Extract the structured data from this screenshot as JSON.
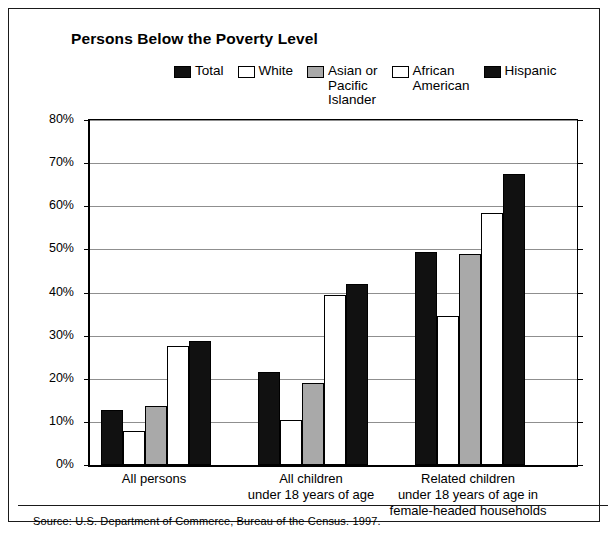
{
  "chart_data": {
    "type": "bar",
    "title": "Persons Below the Poverty Level",
    "xlabel": "",
    "ylabel": "",
    "ylim": [
      0,
      80
    ],
    "ytick_labels": [
      "0%",
      "10%",
      "20%",
      "30%",
      "40%",
      "50%",
      "60%",
      "70%",
      "80%"
    ],
    "ytick_values": [
      0,
      10,
      20,
      30,
      40,
      50,
      60,
      70,
      80
    ],
    "grid": true,
    "legend_position": "top",
    "categories": [
      "All persons",
      "All children\nunder 18 years of age",
      "Related children\nunder 18 years of age in\nfemale-headed households"
    ],
    "series": [
      {
        "name": "Total",
        "values": [
          12.7,
          21.5,
          49.5
        ],
        "fill": "#111111",
        "stroke": "#000000"
      },
      {
        "name": "White",
        "values": [
          8.0,
          10.5,
          34.5
        ],
        "fill": "#ffffff",
        "stroke": "#000000"
      },
      {
        "name": "Asian or\nPacific\nIslander",
        "values": [
          13.7,
          19.0,
          49.0
        ],
        "fill": "#a9a9a9",
        "stroke": "#000000"
      },
      {
        "name": "African\nAmerican",
        "values": [
          27.5,
          39.5,
          58.5
        ],
        "fill": "#ffffff",
        "stroke": "#000000"
      },
      {
        "name": "Hispanic",
        "values": [
          28.8,
          42.0,
          67.5
        ],
        "fill": "#111111",
        "stroke": "#000000"
      }
    ],
    "source": "Source:  U.S. Department of Commerce, Bureau of the Census. 1997."
  }
}
